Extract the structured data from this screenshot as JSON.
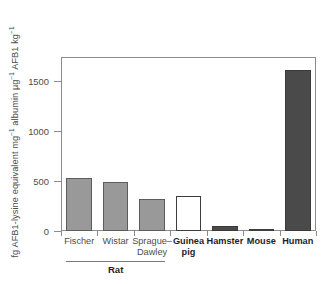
{
  "chart_data": {
    "type": "bar",
    "title": "",
    "xlabel": "",
    "ylabel": "fg AFB1-lysine equivalent mg-1 albumin µg-1 AFB1 kg-1",
    "ylabel_parts": [
      {
        "text": "fg AFB1-lysine equivalent mg",
        "sup": "−1"
      },
      {
        "text": " albumin µg",
        "sup": "−1"
      },
      {
        "text": " AFB1 kg",
        "sup": "−1"
      }
    ],
    "ylim": [
      0,
      1740
    ],
    "yticks": [
      0,
      500,
      1000,
      1500
    ],
    "ytick_labels": [
      "0",
      "500",
      "1000",
      "1500"
    ],
    "grid": false,
    "legend": "none",
    "categories": [
      "Fischer",
      "Wistar",
      "Sprague–\nDawley",
      "Guinea\npig",
      "Hamster",
      "Mouse",
      "Human"
    ],
    "values": [
      530,
      490,
      320,
      355,
      55,
      25,
      1615
    ],
    "bar_styles": [
      "gray",
      "gray",
      "gray",
      "white",
      "dark",
      "white",
      "dark"
    ],
    "label_bold": [
      false,
      false,
      false,
      true,
      true,
      true,
      true
    ],
    "group_annotation": {
      "label": "Rat",
      "covers": [
        "Fischer",
        "Wistar",
        "Sprague–Dawley"
      ]
    }
  },
  "colors": {
    "gray_fill": "#999999",
    "white_fill": "#ffffff",
    "dark_fill": "#4a4a4a",
    "axis": "#8c8c8c",
    "text": "#4d4d4d",
    "bold_text": "#1f1f1f"
  }
}
